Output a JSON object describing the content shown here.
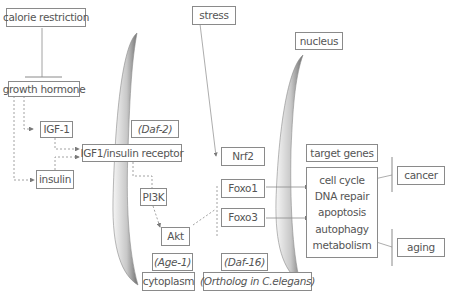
{
  "diagram": {
    "nodes": {
      "calorie_restriction": "calorie restriction",
      "growth_hormone": "growth hormone",
      "igf1": "IGF-1",
      "insulin": "insulin",
      "receptor": "IGF1/insulin receptor",
      "daf2": "(Daf-2)",
      "pi3k": "PI3K",
      "akt": "Akt",
      "age1": "(Age-1)",
      "stress": "stress",
      "nrf2": "Nrf2",
      "foxo1": "Foxo1",
      "foxo3": "Foxo3",
      "daf16": "(Daf-16)",
      "nucleus": "nucleus",
      "cytoplasm": "cytoplasm",
      "ortholog": "(Ortholog in C.elegans)",
      "target_genes": "target genes",
      "cancer": "cancer",
      "aging": "aging"
    },
    "target_gene_list": [
      "cell cycle",
      "DNA repair",
      "apoptosis",
      "autophagy",
      "metabolism"
    ],
    "colors": {
      "line": "#8a8a8a",
      "membrane_dark": "#7a7a7a",
      "membrane_light": "#f4f4f4",
      "text": "#555555"
    }
  }
}
